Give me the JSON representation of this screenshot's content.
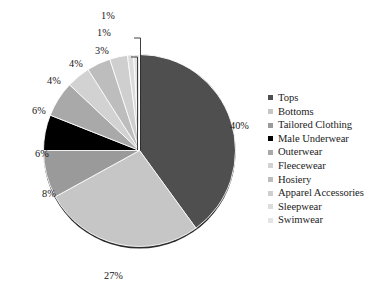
{
  "chart_data": {
    "type": "pie",
    "title": "",
    "xlabel": "",
    "ylabel": "",
    "legend_position": "right",
    "grid": false,
    "value_suffix": "%",
    "start_angle_deg": 0,
    "direction": "clockwise",
    "categories": [
      "Tops",
      "Bottoms",
      "Tailored Clothing",
      "Male Underwear",
      "Outerwear",
      "Fleecewear",
      "Hosiery",
      "Apparel Accessories",
      "Sleepwear",
      "Swimwear"
    ],
    "values": [
      40,
      27,
      8,
      6,
      6,
      4,
      4,
      3,
      1,
      1
    ],
    "labels": [
      "40%",
      "27%",
      "8%",
      "6%",
      "6%",
      "4%",
      "4%",
      "3%",
      "1%",
      "1%"
    ],
    "colors": [
      "#4f4f4f",
      "#c6c6c6",
      "#9a9a9a",
      "#000000",
      "#a9a9a9",
      "#d2d2d2",
      "#bdbdbd",
      "#cfcfcf",
      "#dcdcdc",
      "#e4e4e4"
    ],
    "slice_border_color": "#ffffff"
  },
  "legend": {
    "items": [
      {
        "label": "Tops",
        "color": "#4f4f4f"
      },
      {
        "label": "Bottoms",
        "color": "#c6c6c6"
      },
      {
        "label": "Tailored Clothing",
        "color": "#9a9a9a"
      },
      {
        "label": "Male Underwear",
        "color": "#000000"
      },
      {
        "label": "Outerwear",
        "color": "#a9a9a9"
      },
      {
        "label": "Fleecewear",
        "color": "#d2d2d2"
      },
      {
        "label": "Hosiery",
        "color": "#bdbdbd"
      },
      {
        "label": "Apparel Accessories",
        "color": "#cfcfcf"
      },
      {
        "label": "Sleepwear",
        "color": "#dcdcdc"
      },
      {
        "label": "Swimwear",
        "color": "#e4e4e4"
      }
    ]
  },
  "value_labels": [
    {
      "text": "40%",
      "x": 230,
      "y": 120
    },
    {
      "text": "27%",
      "x": 104,
      "y": 270
    },
    {
      "text": "8%",
      "x": 42,
      "y": 188
    },
    {
      "text": "6%",
      "x": 35,
      "y": 148
    },
    {
      "text": "6%",
      "x": 32,
      "y": 105
    },
    {
      "text": "4%",
      "x": 47,
      "y": 75
    },
    {
      "text": "4%",
      "x": 69,
      "y": 58
    },
    {
      "text": "3%",
      "x": 95,
      "y": 45
    },
    {
      "text": "1%",
      "x": 97,
      "y": 27
    },
    {
      "text": "1%",
      "x": 101,
      "y": 10
    }
  ]
}
